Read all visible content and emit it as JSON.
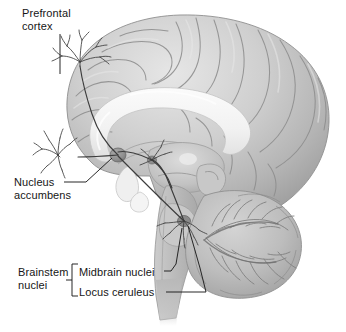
{
  "figure": {
    "type": "anatomical-illustration",
    "style": "grayscale shaded medical drawing",
    "background_color": "#ffffff",
    "ink_color": "#161616",
    "labels": {
      "prefrontal_cortex": "Prefrontal\ncortex",
      "nucleus_accumbens": "Nucleus\naccumbens",
      "brainstem_nuclei": "Brainstem\nnuclei",
      "midbrain_nuclei": "Midbrain nuclei",
      "locus_ceruleus": "Locus ceruleus"
    },
    "structures": [
      "cerebral cortex",
      "corpus callosum",
      "thalamus",
      "midbrain",
      "pons",
      "medulla",
      "cerebellum",
      "nucleus accumbens",
      "locus ceruleus"
    ]
  }
}
